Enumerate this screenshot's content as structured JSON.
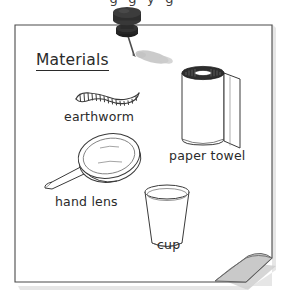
{
  "page": {
    "background_color": "#ffffff",
    "cut_off_top_text": "g g y g"
  },
  "paper": {
    "name": "materials-list-note",
    "fill_color": "#ffffff",
    "border_color": "#4a4a4a",
    "curl_shade_color": "#c9c9c9",
    "shadow_color": "#d9d9d9"
  },
  "pushpin": {
    "name": "pushpin",
    "body_color": "#2b2b2b",
    "needle_color": "#4d4d4d",
    "shadow_color": "#bdbdbd"
  },
  "note": {
    "heading": "Materials",
    "items": [
      {
        "icon": "earthworm-icon",
        "label": "earthworm",
        "stroke_color": "#3a3a3a"
      },
      {
        "icon": "paper-towel-roll-icon",
        "label": "paper towel",
        "stroke_color": "#3a3a3a",
        "top_fill_color": "#2e2e2e"
      },
      {
        "icon": "hand-lens-icon",
        "label": "hand lens",
        "stroke_color": "#3a3a3a"
      },
      {
        "icon": "cup-icon",
        "label": "cup",
        "stroke_color": "#3a3a3a"
      }
    ]
  }
}
